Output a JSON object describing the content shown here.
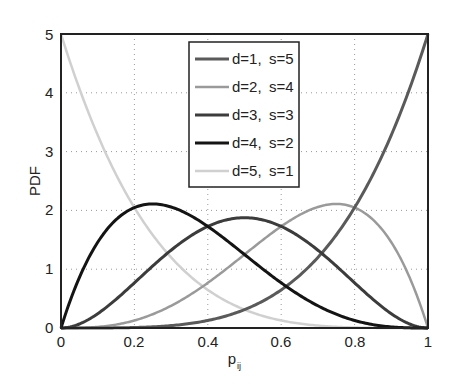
{
  "chart_data": {
    "type": "line",
    "title": "",
    "xlabel": "p",
    "xlabel_subscript": "ij",
    "ylabel": "PDF",
    "xlim": [
      0,
      1
    ],
    "ylim": [
      0,
      5
    ],
    "grid": true,
    "legend_position": "upper center",
    "x_ticks": [
      "0",
      "0.2",
      "0.4",
      "0.6",
      "0.8",
      "1"
    ],
    "y_ticks": [
      "0",
      "1",
      "2",
      "3",
      "4",
      "5"
    ],
    "x": [
      0,
      0.05,
      0.1,
      0.15,
      0.2,
      0.25,
      0.3,
      0.35,
      0.4,
      0.45,
      0.5,
      0.55,
      0.6,
      0.65,
      0.7,
      0.75,
      0.8,
      0.85,
      0.9,
      0.95,
      1
    ],
    "series": [
      {
        "name": "d=1, s=5",
        "color": "#5a5a5a",
        "width": 3,
        "formula": "5x^4",
        "values": [
          0,
          3.13e-05,
          0.0005,
          0.00253,
          0.008,
          0.0195,
          0.0405,
          0.075,
          0.128,
          0.205,
          0.3125,
          0.4575,
          0.648,
          0.8925,
          1.2005,
          1.582,
          2.048,
          2.61,
          3.2805,
          4.0725,
          5
        ]
      },
      {
        "name": "d=2, s=4",
        "color": "#9a9a9a",
        "width": 2.5,
        "formula": "20x^3(1-x)",
        "values": [
          0,
          0.0024,
          0.018,
          0.0574,
          0.128,
          0.2344,
          0.378,
          0.5574,
          0.768,
          1.0024,
          1.25,
          1.4974,
          1.728,
          1.9224,
          2.058,
          2.1094,
          2.048,
          1.8424,
          1.458,
          0.8574,
          0
        ]
      },
      {
        "name": "d=3, s=3",
        "color": "#3c3c3c",
        "width": 3,
        "formula": "30x^2(1-x)^2",
        "values": [
          0,
          0.0677,
          0.243,
          0.4877,
          0.768,
          1.0547,
          1.323,
          1.5527,
          1.728,
          1.8377,
          1.875,
          1.8377,
          1.728,
          1.5527,
          1.323,
          1.0547,
          0.768,
          0.4877,
          0.243,
          0.0677,
          0
        ]
      },
      {
        "name": "d=4, s=2",
        "color": "#141414",
        "width": 3,
        "formula": "20x(1-x)^3",
        "values": [
          0,
          0.8574,
          1.458,
          1.8424,
          2.048,
          2.1094,
          2.058,
          1.9224,
          1.728,
          1.4974,
          1.25,
          1.0024,
          0.768,
          0.5574,
          0.378,
          0.2344,
          0.128,
          0.0574,
          0.018,
          0.0024,
          0
        ]
      },
      {
        "name": "d=5, s=1",
        "color": "#d0d0d0",
        "width": 2.5,
        "formula": "5(1-x)^4",
        "values": [
          5,
          4.0725,
          3.2805,
          2.61,
          2.048,
          1.582,
          1.2005,
          0.8925,
          0.648,
          0.4575,
          0.3125,
          0.205,
          0.128,
          0.075,
          0.0405,
          0.0195,
          0.008,
          0.00253,
          0.0005,
          3.13e-05,
          0
        ]
      }
    ]
  },
  "legend": {
    "items": [
      {
        "d": "d=1,",
        "s": "s=5"
      },
      {
        "d": "d=2,",
        "s": "s=4"
      },
      {
        "d": "d=3,",
        "s": "s=3"
      },
      {
        "d": "d=4,",
        "s": "s=2"
      },
      {
        "d": "d=5,",
        "s": "s=1"
      }
    ]
  },
  "axes": {
    "ylabel": "PDF",
    "xlabel_main": "p",
    "xlabel_sub": "ij",
    "x_ticks": [
      "0",
      "0.2",
      "0.4",
      "0.6",
      "0.8",
      "1"
    ],
    "y_ticks": [
      "0",
      "1",
      "2",
      "3",
      "4",
      "5"
    ]
  }
}
